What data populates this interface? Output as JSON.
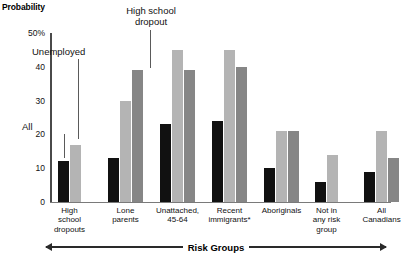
{
  "chart_data": {
    "type": "bar",
    "title": "",
    "ylabel": "Probability",
    "xlabel": "Risk Groups",
    "ylim": [
      0,
      50
    ],
    "yticks": [
      0,
      10,
      20,
      30,
      40,
      50
    ],
    "ytick_labels": [
      "0",
      "10",
      "20",
      "30",
      "40",
      "50%"
    ],
    "grid": false,
    "legend": "annotated-callouts",
    "categories": [
      "High\nschool\ndropouts",
      "Lone\nparents",
      "Unattached,\n45-64",
      "Recent\nimmigrants*",
      "Aboriginals",
      "Not in\nany risk\ngroup",
      "All\nCanadians"
    ],
    "series": [
      {
        "name": "All",
        "color": "#111111",
        "values": [
          12,
          13,
          23,
          24,
          10,
          6,
          9
        ]
      },
      {
        "name": "Unemployed",
        "color": "#b4b4b4",
        "values": [
          17,
          30,
          45,
          45,
          21,
          14,
          21
        ]
      },
      {
        "name": "High school dropout",
        "color": "#868686",
        "values": [
          null,
          39,
          39,
          40,
          21,
          null,
          13
        ]
      }
    ],
    "annotations": [
      {
        "name": "all",
        "label": "All"
      },
      {
        "name": "unemployed",
        "label": "Unemployed"
      },
      {
        "name": "high-school-dropout",
        "label": "High school\ndropout"
      }
    ]
  }
}
